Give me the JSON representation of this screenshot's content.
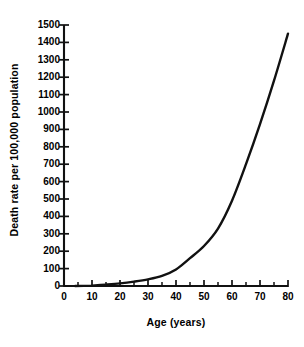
{
  "chart_data": {
    "type": "line",
    "title": "",
    "xlabel": "Age (years)",
    "ylabel": "Death rate per 100,000 population",
    "xlim": [
      0,
      80
    ],
    "ylim": [
      0,
      1500
    ],
    "grid": false,
    "legend": null,
    "x_ticks": [
      0,
      10,
      20,
      30,
      40,
      50,
      60,
      70,
      80
    ],
    "x_tick_labels": [
      "0",
      "10",
      "20",
      "30",
      "40",
      "50",
      "60",
      "70",
      "80"
    ],
    "x_minor_ticks": [
      5,
      15,
      25,
      35,
      45,
      55,
      65,
      75
    ],
    "y_ticks": [
      0,
      100,
      200,
      300,
      400,
      500,
      600,
      700,
      800,
      900,
      1000,
      1100,
      1200,
      1300,
      1400,
      1500
    ],
    "y_tick_labels": [
      "0",
      "100",
      "200",
      "300",
      "400",
      "500",
      "600",
      "700",
      "800",
      "900",
      "1000",
      "1100",
      "1200",
      "1300",
      "1400",
      "1500"
    ],
    "series": [
      {
        "name": "Death rate",
        "x": [
          10,
          15,
          20,
          25,
          30,
          35,
          40,
          45,
          50,
          55,
          60,
          65,
          70,
          75,
          80
        ],
        "values": [
          2,
          8,
          15,
          25,
          38,
          58,
          95,
          160,
          230,
          330,
          490,
          700,
          930,
          1180,
          1450
        ]
      }
    ]
  },
  "style": {
    "line_color": "#111111",
    "axis_color": "#111111",
    "background": "#ffffff"
  }
}
